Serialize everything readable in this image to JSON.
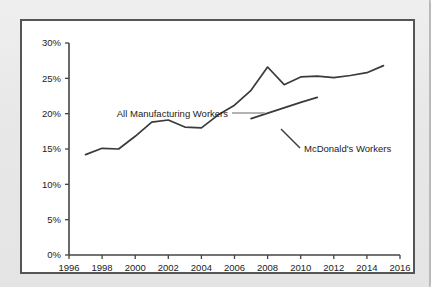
{
  "chart_data": {
    "type": "line",
    "title": "",
    "xlabel": "",
    "ylabel": "",
    "xlim": [
      1996,
      2016
    ],
    "ylim": [
      0,
      30
    ],
    "grid": false,
    "legend_position": "inline-annotations",
    "x_ticks": [
      "1996",
      "1998",
      "2000",
      "2002",
      "2004",
      "2006",
      "2008",
      "2010",
      "2012",
      "2014",
      "2016"
    ],
    "y_ticks": [
      "0%",
      "5%",
      "10%",
      "15%",
      "20%",
      "25%",
      "30%"
    ],
    "series": [
      {
        "name": "All Manufacturing Workers",
        "color": "#3a3a3a",
        "x": [
          1997,
          1998,
          1999,
          2000,
          2001,
          2002,
          2003,
          2004,
          2005,
          2006,
          2007,
          2008,
          2009,
          2010,
          2011,
          2012,
          2013,
          2014,
          2015
        ],
        "values": [
          14.2,
          15.1,
          15.0,
          16.8,
          18.8,
          19.1,
          18.1,
          18.0,
          19.8,
          21.2,
          23.3,
          26.6,
          24.1,
          25.2,
          25.3,
          25.1,
          25.4,
          25.8,
          26.8
        ]
      },
      {
        "name": "McDonald's Workers",
        "color": "#3a3a3a",
        "x": [
          2007,
          2010,
          2011
        ],
        "values": [
          19.3,
          21.6,
          22.3
        ]
      }
    ],
    "annotations": [
      {
        "text": "All Manufacturing Workers",
        "label_x": 78,
        "label_y": 96,
        "leader": {
          "x1": 210,
          "y1": 92,
          "x2": 243,
          "y2": 92,
          "color": "#9a9a9a"
        }
      },
      {
        "text": "McDonald's Workers",
        "label_x": 282,
        "label_y": 131,
        "leader": {
          "x1": 278,
          "y1": 127,
          "x2": 259,
          "y2": 108,
          "color": "#3a3a3a"
        }
      }
    ]
  },
  "colors": {
    "line": "#3a3a3a",
    "axis": "#444444",
    "panel_border": "#555555",
    "panel_background": "#ffffff",
    "page_background": "#e9e9e9",
    "leader_gray": "#9a9a9a"
  }
}
